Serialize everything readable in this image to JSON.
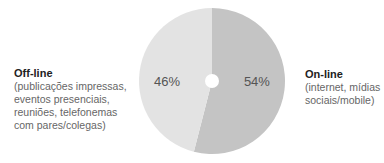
{
  "chart_data": {
    "type": "pie",
    "title": "",
    "donut_hole": true,
    "slices": [
      {
        "name": "On-line",
        "description": "(internet, mídias sociais/mobile)",
        "value": 54,
        "label": "54%",
        "color": "#c4c4c4"
      },
      {
        "name": "Off-line",
        "description": "(publicações impressas, eventos presenciais, reuniões, telefonemas com pares/colegas)",
        "value": 46,
        "label": "46%",
        "color": "#e3e3e3"
      }
    ],
    "categories": [
      "On-line",
      "Off-line"
    ],
    "values": [
      54,
      46
    ],
    "legend_position": "sides"
  },
  "legend": {
    "offline": {
      "title": "Off-line",
      "lines": [
        "(publicações impressas,",
        "eventos presenciais,",
        "reuniões, telefonemas",
        "com pares/colegas)"
      ]
    },
    "online": {
      "title": "On-line",
      "lines": [
        "(internet, mídias",
        "sociais/mobile)"
      ]
    }
  }
}
